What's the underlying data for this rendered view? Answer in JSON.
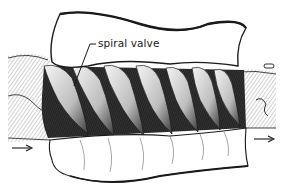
{
  "diagram": {
    "labels": [
      {
        "id": "spiral-valve",
        "text": "spiral valve"
      }
    ],
    "flow_arrows": [
      {
        "id": "inflow-arrow",
        "direction": "right",
        "position": "left"
      },
      {
        "id": "outflow-arrow",
        "direction": "right",
        "position": "right"
      }
    ],
    "spiral_turns": 7,
    "colors": {
      "ink": "#1a1a1a",
      "dark_fill": "#2a2a2a",
      "mid_fill": "#7a7a7a",
      "paper": "#ffffff"
    }
  }
}
